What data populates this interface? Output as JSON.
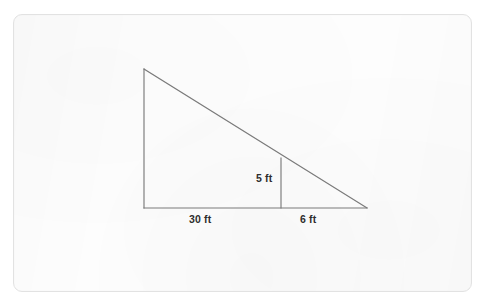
{
  "figure": {
    "kind": "right-triangle-with-interior-altitude",
    "card": {
      "x": 13,
      "y": 14,
      "width": 459,
      "height": 278,
      "background_color": "#fdfdfd",
      "border_color": "#e2e2e2",
      "corner_radius": 9
    },
    "stroke_color": "#7a7a7a",
    "text_color": "#2e2e2e",
    "units": "ft",
    "points": {
      "apex": {
        "x": 144,
        "y": 69
      },
      "bottom_left": {
        "x": 144,
        "y": 208
      },
      "bottom_right": {
        "x": 367,
        "y": 208
      },
      "altitude_top": {
        "x": 281,
        "y": 158
      },
      "altitude_foot": {
        "x": 281,
        "y": 208
      }
    },
    "segments": [
      {
        "name": "vertical-leg",
        "from": "apex",
        "to": "bottom_left",
        "label": ""
      },
      {
        "name": "hypotenuse",
        "from": "apex",
        "to": "bottom_right",
        "label": ""
      },
      {
        "name": "base",
        "from": "bottom_left",
        "to": "bottom_right",
        "label": ""
      },
      {
        "name": "interior-altitude",
        "from": "altitude_top",
        "to": "altitude_foot",
        "label": "5 ft"
      }
    ],
    "labels": {
      "height": "5 ft",
      "base_left_segment": "30 ft",
      "base_right_segment": "6 ft"
    }
  }
}
